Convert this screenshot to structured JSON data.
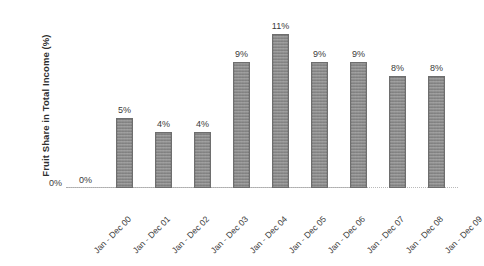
{
  "chart_data": {
    "type": "bar",
    "title": "",
    "subtitle": "",
    "xlabel": "",
    "ylabel": "Fruit Share in Total Income (%)",
    "ylim": [
      0,
      12
    ],
    "grid": false,
    "legend": "none",
    "y_tick_labels": [
      "0%"
    ],
    "categories": [
      "Jan - Dec 00",
      "Jan - Dec 01",
      "Jan - Dec 02",
      "Jan - Dec 03",
      "Jan - Dec 04",
      "Jan - Dec 05",
      "Jan - Dec 06",
      "Jan - Dec 07",
      "Jan - Dec 08",
      "Jan - Dec 09"
    ],
    "values": [
      0,
      5,
      4,
      4,
      9,
      11,
      9,
      9,
      8,
      8
    ],
    "data_labels": [
      "0%",
      "5%",
      "4%",
      "4%",
      "9%",
      "11%",
      "9%",
      "9%",
      "8%",
      "8%"
    ],
    "bar_color": "#8d8d8d",
    "bar_border_color": "#6e6e6e",
    "axis_color": "#a9a9a9",
    "text_color": "#3a3a3a",
    "background": "#ffffff"
  }
}
